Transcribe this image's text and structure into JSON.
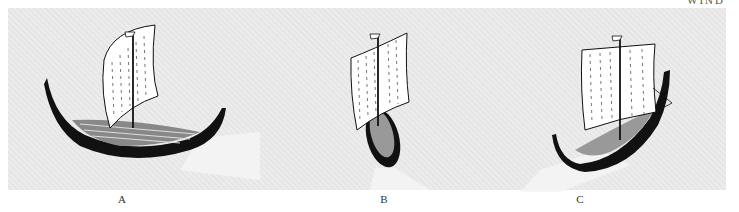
{
  "figure": {
    "wind_label": "WIND",
    "ships": [
      {
        "id": "A",
        "label": "A"
      },
      {
        "id": "B",
        "label": "B"
      },
      {
        "id": "C",
        "label": "C"
      }
    ]
  },
  "colors": {
    "background": "#ffffff",
    "panel": "#e6e6e6",
    "hull": "#111111",
    "sail": "#ffffff",
    "wake": "#f4f4f4"
  }
}
